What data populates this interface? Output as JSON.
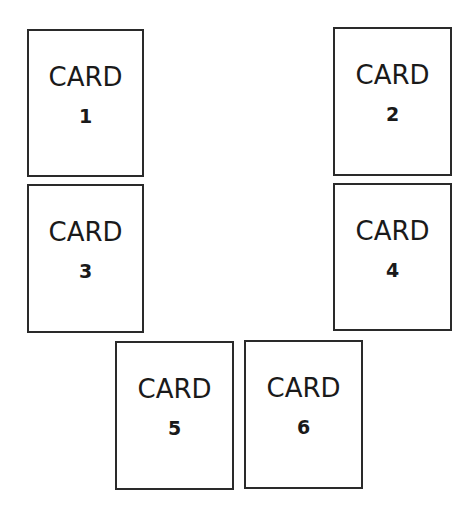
{
  "cards": [
    {
      "title": "CARD",
      "number": "1",
      "x": 27,
      "y": 29,
      "w": 117,
      "h": 148
    },
    {
      "title": "CARD",
      "number": "2",
      "x": 333,
      "y": 27,
      "w": 119,
      "h": 149
    },
    {
      "title": "CARD",
      "number": "3",
      "x": 27,
      "y": 184,
      "w": 117,
      "h": 149
    },
    {
      "title": "CARD",
      "number": "4",
      "x": 333,
      "y": 183,
      "w": 119,
      "h": 148
    },
    {
      "title": "CARD",
      "number": "5",
      "x": 115,
      "y": 341,
      "w": 119,
      "h": 149
    },
    {
      "title": "CARD",
      "number": "6",
      "x": 244,
      "y": 340,
      "w": 119,
      "h": 149
    }
  ],
  "colors": {
    "border": "#2a2a2a",
    "text": "#1a1a1a",
    "background": "#ffffff"
  }
}
